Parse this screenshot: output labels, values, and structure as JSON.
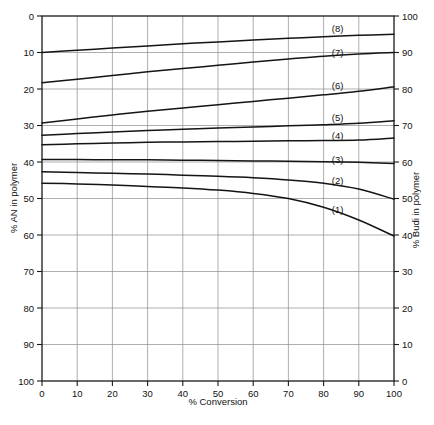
{
  "figure": {
    "header_faint_text": "",
    "background_color": "#ffffff",
    "line_color": "#141414",
    "grid_color": "#8d8d8d"
  },
  "chart_data": {
    "type": "line",
    "title": "",
    "xlabel": "% Conversion",
    "ylabel": "% AN in polymer",
    "y2label": "% Budi in polymer",
    "xlim": [
      0,
      100
    ],
    "ylim": [
      0,
      100
    ],
    "y2lim": [
      0,
      100
    ],
    "y_inverted": true,
    "grid": true,
    "legend": "inline-curve-labels",
    "xticks": [
      0,
      10,
      20,
      30,
      40,
      50,
      60,
      70,
      80,
      90,
      100
    ],
    "xticklabels": [
      "0",
      "10",
      "20",
      "30",
      "40",
      "50",
      "60",
      "70",
      "80",
      "90",
      "100"
    ],
    "yticks": [
      0,
      10,
      20,
      30,
      40,
      50,
      60,
      70,
      80,
      90,
      100
    ],
    "yticklabels": [
      "0",
      "10",
      "20",
      "30",
      "40",
      "50",
      "60",
      "70",
      "80",
      "90",
      "100"
    ],
    "y2ticks": [
      0,
      10,
      20,
      30,
      40,
      50,
      60,
      70,
      80,
      90,
      100
    ],
    "y2ticklabels": [
      "100",
      "90",
      "80",
      "70",
      "60",
      "50",
      "40",
      "30",
      "20",
      "10",
      "0"
    ],
    "series": [
      {
        "name": "(8)",
        "label": "(8)",
        "label_x": 84,
        "label_y": 4.5,
        "x": [
          0,
          10,
          20,
          30,
          40,
          50,
          60,
          70,
          80,
          90,
          100
        ],
        "y": [
          10.0,
          9.4,
          8.8,
          8.2,
          7.6,
          7.1,
          6.6,
          6.1,
          5.7,
          5.3,
          5.0
        ]
      },
      {
        "name": "(7)",
        "label": "(7)",
        "label_x": 84,
        "label_y": 11.0,
        "x": [
          0,
          10,
          20,
          30,
          40,
          50,
          60,
          70,
          80,
          90,
          100
        ],
        "y": [
          18.3,
          17.3,
          16.3,
          15.3,
          14.4,
          13.5,
          12.6,
          11.8,
          11.0,
          10.4,
          10.0
        ]
      },
      {
        "name": "(6)",
        "label": "(6)",
        "label_x": 84,
        "label_y": 20.0,
        "x": [
          0,
          10,
          20,
          30,
          40,
          50,
          60,
          70,
          80,
          90,
          100
        ],
        "y": [
          29.3,
          28.2,
          27.1,
          26.1,
          25.2,
          24.3,
          23.4,
          22.5,
          21.6,
          20.6,
          19.4
        ]
      },
      {
        "name": "(5)",
        "label": "(5)",
        "label_x": 84,
        "label_y": 28.8,
        "x": [
          0,
          10,
          20,
          30,
          40,
          50,
          60,
          70,
          80,
          90,
          100
        ],
        "y": [
          32.7,
          32.2,
          31.8,
          31.4,
          31.0,
          30.7,
          30.4,
          30.1,
          29.8,
          29.4,
          28.7
        ]
      },
      {
        "name": "(4)",
        "label": "(4)",
        "label_x": 84,
        "label_y": 33.6,
        "x": [
          0,
          10,
          20,
          30,
          40,
          50,
          60,
          70,
          80,
          90,
          100
        ],
        "y": [
          35.3,
          35.0,
          34.8,
          34.6,
          34.5,
          34.4,
          34.3,
          34.2,
          34.1,
          34.0,
          33.4
        ]
      },
      {
        "name": "(3)",
        "label": "(3)",
        "label_x": 84,
        "label_y": 40.3,
        "x": [
          0,
          10,
          20,
          30,
          40,
          50,
          60,
          70,
          80,
          90,
          100
        ],
        "y": [
          39.3,
          39.3,
          39.4,
          39.4,
          39.5,
          39.6,
          39.7,
          39.8,
          39.9,
          40.1,
          40.4
        ]
      },
      {
        "name": "(2)",
        "label": "(2)",
        "label_x": 84,
        "label_y": 46.0,
        "x": [
          0,
          10,
          20,
          30,
          40,
          50,
          60,
          70,
          80,
          90,
          100
        ],
        "y": [
          42.7,
          42.9,
          43.1,
          43.3,
          43.6,
          43.9,
          44.3,
          44.9,
          45.8,
          47.4,
          50.2
        ]
      },
      {
        "name": "(1)",
        "label": "(1)",
        "label_x": 84,
        "label_y": 54.0,
        "x": [
          0,
          10,
          20,
          30,
          40,
          50,
          60,
          70,
          80,
          90,
          100
        ],
        "y": [
          45.8,
          46.0,
          46.3,
          46.7,
          47.1,
          47.7,
          48.6,
          50.0,
          52.4,
          55.9,
          60.3
        ]
      }
    ]
  }
}
